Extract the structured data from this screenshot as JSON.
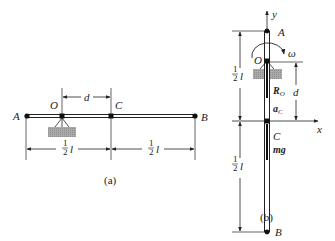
{
  "figure_a": {
    "caption": "(a)",
    "labels": {
      "A": "A",
      "O": "O",
      "C": "C",
      "B": "B",
      "d": "d"
    },
    "half_length": {
      "num": "1",
      "den": "2",
      "var": "l"
    }
  },
  "figure_b": {
    "caption": "(b)",
    "labels": {
      "A": "A",
      "O": "O",
      "C": "C",
      "B": "B",
      "d": "d",
      "x_axis": "x",
      "y_axis": "y",
      "omega": "ω"
    },
    "vectors": {
      "reaction": "R",
      "reaction_sub": "O",
      "accel": "a",
      "accel_sub": "C",
      "weight": "mg"
    },
    "half_length": {
      "num": "1",
      "den": "2",
      "var": "l"
    }
  },
  "colors": {
    "ink": "#222222",
    "ground": "#a9a9a9"
  }
}
